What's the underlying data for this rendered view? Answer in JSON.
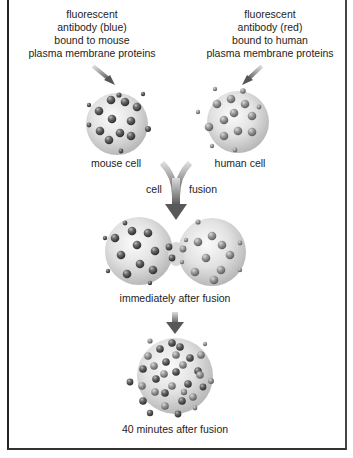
{
  "figure": {
    "labels": {
      "mouse_antibody": [
        "fluorescent",
        "antibody (blue)",
        "bound to mouse",
        "plasma membrane proteins"
      ],
      "human_antibody": [
        "fluorescent",
        "antibody (red)",
        "bound to human",
        "plasma membrane proteins"
      ],
      "mouse_cell": "mouse cell",
      "human_cell": "human cell",
      "fusion_left": "cell",
      "fusion_right": "fusion",
      "stage_immediate": "immediately after fusion",
      "stage_40min": "40 minutes after fusion"
    },
    "colors": {
      "cell_fill": "#e4e4e4",
      "cell_shadow": "#bdbdbd",
      "protein_blue_mouse": "#5a5a5a",
      "protein_red_human": "#8a8a8a",
      "arrow": "#6f6f6f",
      "frame": "#222222"
    },
    "stages": [
      {
        "name": "mouse cell",
        "protein_type": "blue (mouse)"
      },
      {
        "name": "human cell",
        "protein_type": "red (human)"
      },
      {
        "name": "immediately after fusion",
        "protein_type": "segregated blue and red"
      },
      {
        "name": "40 minutes after fusion",
        "protein_type": "intermixed blue and red"
      }
    ]
  }
}
